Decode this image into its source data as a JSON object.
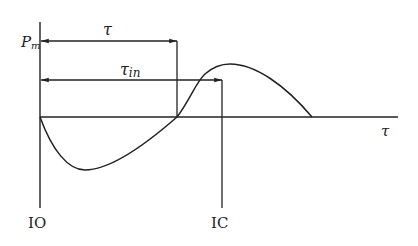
{
  "diagram": {
    "title": "",
    "stroke_color": "#222222",
    "background": "#ffffff",
    "axes": {
      "y_label": "P",
      "y_label_sub": "m",
      "x_label": "τ"
    },
    "dimensions": {
      "tau": {
        "label": "τ",
        "from": "IO",
        "to": "pressure zero-crossing"
      },
      "tau_in": {
        "label": "τ",
        "label_sub": "in",
        "from": "IO",
        "to": "IC"
      }
    },
    "markers": {
      "io": {
        "label": "IO"
      },
      "ic": {
        "label": "IC"
      }
    },
    "curve": {
      "description": "Pressure difference P_m vs time: negative lobe from IO, zero-crossing at end of τ, positive lobe peaking after, returning to zero",
      "segments": [
        {
          "name": "negative-lobe",
          "sign": "negative"
        },
        {
          "name": "positive-lobe",
          "sign": "positive"
        }
      ]
    }
  }
}
